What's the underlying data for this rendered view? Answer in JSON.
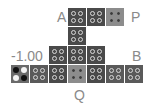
{
  "labels": {
    "a": "A",
    "p": "P",
    "b": "B",
    "q": "Q",
    "value": "-1.00"
  },
  "tiles": [
    {
      "row": 0,
      "col": 3,
      "shade": "dark"
    },
    {
      "row": 0,
      "col": 4,
      "shade": "dark"
    },
    {
      "row": 0,
      "col": 5,
      "shade": "light"
    },
    {
      "row": 1,
      "col": 3,
      "shade": "dark"
    },
    {
      "row": 2,
      "col": 2,
      "shade": "dark"
    },
    {
      "row": 2,
      "col": 3,
      "shade": "dark"
    },
    {
      "row": 2,
      "col": 4,
      "shade": "dark"
    },
    {
      "row": 3,
      "col": 0,
      "shade": "special",
      "dots": [
        "black",
        "white",
        "white",
        "black"
      ]
    },
    {
      "row": 3,
      "col": 1,
      "shade": "mid"
    },
    {
      "row": 3,
      "col": 2,
      "shade": "dark"
    },
    {
      "row": 3,
      "col": 3,
      "shade": "light"
    },
    {
      "row": 3,
      "col": 4,
      "shade": "dark"
    },
    {
      "row": 3,
      "col": 5,
      "shade": "mid"
    },
    {
      "row": 3,
      "col": 6,
      "shade": "mid"
    }
  ]
}
